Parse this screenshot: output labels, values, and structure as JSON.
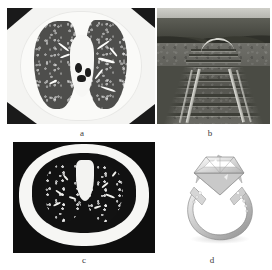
{
  "figure": {
    "background_color": "#ffffff",
    "layout": "2x2 image panel grid",
    "panels": [
      {
        "id": "a",
        "label": "a",
        "content_type": "grayscale-ct-scan",
        "description": "Axial chest CT slice showing both lungs with airways and pulmonary vessels",
        "position": "top-left"
      },
      {
        "id": "b",
        "label": "b",
        "content_type": "grayscale-photograph",
        "description": "Railway track receding into the distance with trees on both sides",
        "position": "top-right"
      },
      {
        "id": "c",
        "label": "c",
        "content_type": "grayscale-ct-scan",
        "description": "Darker axial chest CT slice showing both lungs with bright vessel cross-sections",
        "position": "bottom-left"
      },
      {
        "id": "d",
        "label": "d",
        "content_type": "product-photograph",
        "description": "Princess-cut solitaire diamond engagement ring with pave set band on white background",
        "position": "bottom-right"
      }
    ]
  },
  "colors": {
    "page_background": "#ffffff",
    "ct_dark": "#121212",
    "ct_tissue": "#f6f6f4",
    "photo_mid_gray": "#6d6d6a",
    "label_text": "#3a3a3a"
  }
}
